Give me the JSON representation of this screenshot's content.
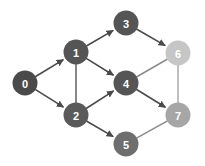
{
  "graph": {
    "title": "directed acyclic graph",
    "layout": "layered",
    "node_radius": 12.5,
    "canvas": {
      "width": 205,
      "height": 166,
      "background": "#ffffff"
    },
    "nodes": [
      {
        "id": "0",
        "label": "0",
        "x": 25,
        "y": 83,
        "color": "#4a4a4a",
        "text_color": "#ffffff"
      },
      {
        "id": "1",
        "label": "1",
        "x": 76,
        "y": 52,
        "color": "#555555",
        "text_color": "#ffffff"
      },
      {
        "id": "2",
        "label": "2",
        "x": 76,
        "y": 115,
        "color": "#5a5a5a",
        "text_color": "#ffffff"
      },
      {
        "id": "3",
        "label": "3",
        "x": 126,
        "y": 23,
        "color": "#555555",
        "text_color": "#ffffff"
      },
      {
        "id": "4",
        "label": "4",
        "x": 126,
        "y": 83,
        "color": "#555555",
        "text_color": "#ffffff"
      },
      {
        "id": "5",
        "label": "5",
        "x": 126,
        "y": 144,
        "color": "#6e6e6e",
        "text_color": "#ffffff"
      },
      {
        "id": "6",
        "label": "6",
        "x": 178,
        "y": 53,
        "color": "#c6c6c6",
        "text_color": "#ffffff"
      },
      {
        "id": "7",
        "label": "7",
        "x": 178,
        "y": 115,
        "color": "#a6a6a6",
        "text_color": "#ffffff"
      }
    ],
    "edges": [
      {
        "from": "0",
        "to": "1",
        "arrow": true,
        "color": "#4a4a4a"
      },
      {
        "from": "0",
        "to": "2",
        "arrow": true,
        "color": "#4a4a4a"
      },
      {
        "from": "1",
        "to": "3",
        "arrow": true,
        "color": "#4a4a4a"
      },
      {
        "from": "1",
        "to": "4",
        "arrow": true,
        "color": "#4a4a4a"
      },
      {
        "from": "1",
        "to": "2",
        "arrow": false,
        "color": "#6a6a6a"
      },
      {
        "from": "2",
        "to": "4",
        "arrow": true,
        "color": "#4a4a4a"
      },
      {
        "from": "2",
        "to": "5",
        "arrow": true,
        "color": "#4a4a4a"
      },
      {
        "from": "3",
        "to": "6",
        "arrow": true,
        "color": "#4a4a4a"
      },
      {
        "from": "4",
        "to": "6",
        "arrow": false,
        "color": "#8c8c8c"
      },
      {
        "from": "4",
        "to": "7",
        "arrow": true,
        "color": "#4a4a4a"
      },
      {
        "from": "5",
        "to": "7",
        "arrow": false,
        "color": "#8c8c8c"
      },
      {
        "from": "6",
        "to": "7",
        "arrow": false,
        "color": "#b0b0b0"
      }
    ]
  }
}
